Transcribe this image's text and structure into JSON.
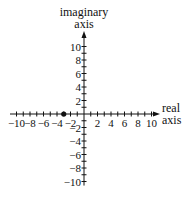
{
  "chart_data": {
    "type": "scatter",
    "title": "",
    "xlabel": "real axis",
    "ylabel": "imaginary axis",
    "xlabel_lines": [
      "real",
      "axis"
    ],
    "ylabel_lines": [
      "imaginary",
      "axis"
    ],
    "xlim": [
      -11,
      11
    ],
    "ylim": [
      -11,
      11
    ],
    "x_ticks_labeled": [
      -10,
      -8,
      -6,
      -4,
      -2,
      2,
      4,
      6,
      8,
      10
    ],
    "y_ticks_labeled": [
      10,
      8,
      6,
      4,
      2,
      -2,
      -4,
      -6,
      -8,
      -10
    ],
    "minor_tick_step": 1,
    "grid": false,
    "points": [
      {
        "x": -3,
        "y": 0,
        "label": "-3"
      }
    ],
    "colors": {
      "axis": "#111111",
      "point": "#111111"
    }
  }
}
